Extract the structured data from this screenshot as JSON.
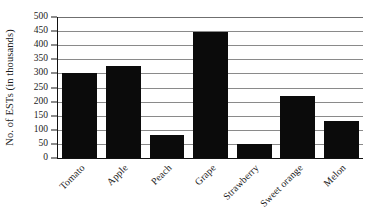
{
  "chart_data": {
    "type": "bar",
    "title": "",
    "subtitle": "",
    "xlabel": "",
    "ylabel": "No. of ESTs (in thousands)",
    "categories": [
      "Tomato",
      "Apple",
      "Peach",
      "Grape",
      "Strawberry",
      "Sweet orange",
      "Melon"
    ],
    "values": [
      302,
      325,
      80,
      448,
      48,
      220,
      130
    ],
    "series": [
      {
        "name": "No. of ESTs",
        "values": [
          302,
          325,
          80,
          448,
          48,
          220,
          130
        ]
      }
    ],
    "ylim": [
      0,
      500
    ],
    "ytick_step": 50,
    "ytick_labels": [
      "0",
      "50",
      "100",
      "150",
      "200",
      "250",
      "300",
      "350",
      "400",
      "450",
      "500"
    ],
    "ytick_values": [
      0,
      50,
      100,
      150,
      200,
      250,
      300,
      350,
      400,
      450,
      500
    ],
    "grid": "horizontal",
    "legend": "none",
    "bar_color": "#0b0b0b",
    "gridline_color": "#8a8a8a",
    "axis_color": "#111111",
    "background_color": "#ffffff",
    "xtick_label_rotation": "-45",
    "annotations": []
  }
}
